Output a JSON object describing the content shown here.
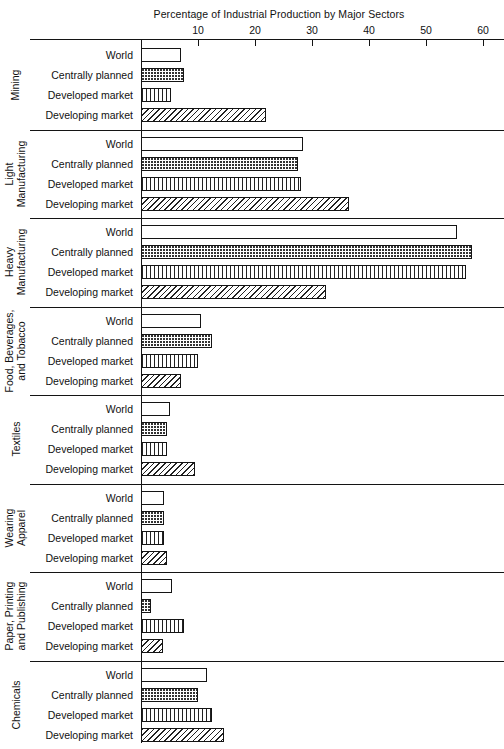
{
  "chart_data": {
    "type": "bar",
    "orientation": "horizontal",
    "title": "Percentage of Industrial Production by Major Sectors",
    "xlabel": "",
    "ylabel": "",
    "xlim": [
      0,
      63
    ],
    "xticks": [
      10,
      20,
      30,
      40,
      50,
      60
    ],
    "xtick_labels": [
      "10",
      "20",
      "30",
      "40",
      "50",
      "60"
    ],
    "grid": false,
    "legend": "none",
    "categories": [
      "World",
      "Centrally planned",
      "Developed market",
      "Developing market"
    ],
    "series_patterns": [
      "none",
      "dots",
      "vertical",
      "diagonal"
    ],
    "groups": [
      {
        "name": "Mining",
        "values": [
          7.0,
          7.5,
          5.2,
          22.0
        ]
      },
      {
        "name": "Light Manufacturing",
        "values": [
          28.5,
          27.5,
          28.0,
          36.5
        ]
      },
      {
        "name": "Heavy Manufacturing",
        "values": [
          55.5,
          58.0,
          57.0,
          32.5
        ]
      },
      {
        "name": "Food, Beverages, and Tobacco",
        "values": [
          10.5,
          12.5,
          10.0,
          7.0
        ]
      },
      {
        "name": "Textiles",
        "values": [
          5.0,
          4.5,
          4.5,
          9.5
        ]
      },
      {
        "name": "Wearing Apparel",
        "values": [
          4.0,
          4.0,
          4.0,
          4.5
        ]
      },
      {
        "name": "Paper, Printing and Publishing",
        "values": [
          5.5,
          1.8,
          7.5,
          3.8
        ]
      },
      {
        "name": "Chemicals",
        "values": [
          11.5,
          10.0,
          12.5,
          14.5
        ]
      }
    ]
  },
  "sections": [
    {
      "label": "Mining"
    },
    {
      "label": "Light\nManufacturing"
    },
    {
      "label": "Heavy\nManufacturing"
    },
    {
      "label": "Food, Beverages,\nand Tobacco"
    },
    {
      "label": "Textiles"
    },
    {
      "label": "Wearing\nApparel"
    },
    {
      "label": "Paper, Printing\nand Publishing"
    },
    {
      "label": "Chemicals"
    }
  ]
}
